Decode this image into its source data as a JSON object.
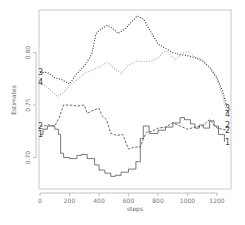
{
  "chart_data": {
    "type": "line",
    "title": "",
    "xlabel": "steps",
    "ylabel": "Estimates",
    "xlim": [
      0,
      1280
    ],
    "ylim": [
      0.68,
      0.84
    ],
    "xticks": [
      0,
      200,
      400,
      600,
      800,
      1000,
      1200
    ],
    "yticks": [
      0.7,
      0.75,
      0.8
    ],
    "ytick_labels": [
      "0.70",
      "0.75",
      "0.80"
    ],
    "grid": false,
    "legend": "line end labels (1-4) on left and right edges",
    "series": [
      {
        "name": "1",
        "style": "solid",
        "color": "#555555",
        "x": [
          0,
          20,
          50,
          100,
          125,
          140,
          160,
          200,
          250,
          280,
          320,
          370,
          400,
          440,
          480,
          510,
          550,
          600,
          640,
          650,
          680,
          700,
          740,
          800,
          850,
          900,
          950,
          980,
          1020,
          1050,
          1080,
          1110,
          1150,
          1180,
          1210,
          1250
        ],
        "values": [
          0.722,
          0.727,
          0.73,
          0.727,
          0.722,
          0.704,
          0.7,
          0.699,
          0.702,
          0.703,
          0.699,
          0.693,
          0.688,
          0.685,
          0.682,
          0.683,
          0.686,
          0.689,
          0.689,
          0.696,
          0.718,
          0.73,
          0.723,
          0.726,
          0.729,
          0.733,
          0.738,
          0.736,
          0.732,
          0.728,
          0.731,
          0.728,
          0.735,
          0.73,
          0.722,
          0.715
        ]
      },
      {
        "name": "2",
        "style": "dashed",
        "color": "#444444",
        "x": [
          0,
          30,
          60,
          100,
          130,
          160,
          200,
          250,
          300,
          320,
          360,
          400,
          420,
          450,
          480,
          520,
          560,
          600,
          640,
          680,
          720,
          760,
          800,
          850,
          900,
          950,
          1000,
          1050,
          1100,
          1150,
          1200,
          1270
        ],
        "values": [
          0.73,
          0.73,
          0.731,
          0.73,
          0.738,
          0.75,
          0.75,
          0.749,
          0.75,
          0.742,
          0.745,
          0.747,
          0.74,
          0.736,
          0.723,
          0.721,
          0.722,
          0.708,
          0.71,
          0.71,
          0.724,
          0.725,
          0.728,
          0.729,
          0.733,
          0.73,
          0.727,
          0.729,
          0.73,
          0.736,
          0.728,
          0.726
        ]
      },
      {
        "name": "3",
        "style": "dotted",
        "color": "#333333",
        "x": [
          0,
          50,
          100,
          150,
          200,
          250,
          300,
          350,
          380,
          420,
          460,
          500,
          530,
          580,
          620,
          660,
          700,
          750,
          800,
          850,
          900,
          950,
          1000,
          1050,
          1100,
          1150,
          1200,
          1240,
          1270
        ],
        "values": [
          0.781,
          0.781,
          0.776,
          0.774,
          0.77,
          0.78,
          0.787,
          0.798,
          0.818,
          0.823,
          0.826,
          0.822,
          0.818,
          0.823,
          0.829,
          0.835,
          0.832,
          0.82,
          0.808,
          0.804,
          0.8,
          0.798,
          0.797,
          0.795,
          0.792,
          0.786,
          0.776,
          0.762,
          0.747
        ]
      },
      {
        "name": "4",
        "style": "dotted",
        "color": "#aaaaaa",
        "x": [
          0,
          40,
          80,
          120,
          160,
          200,
          250,
          300,
          350,
          400,
          460,
          500,
          550,
          600,
          650,
          700,
          760,
          800,
          850,
          880,
          920,
          960,
          1000,
          1050,
          1100,
          1150,
          1200,
          1240,
          1270
        ],
        "values": [
          0.772,
          0.768,
          0.763,
          0.758,
          0.762,
          0.768,
          0.774,
          0.78,
          0.783,
          0.786,
          0.791,
          0.785,
          0.78,
          0.788,
          0.792,
          0.791,
          0.792,
          0.795,
          0.802,
          0.798,
          0.793,
          0.799,
          0.801,
          0.796,
          0.793,
          0.785,
          0.775,
          0.757,
          0.741
        ]
      }
    ],
    "left_labels": [
      {
        "text": "3",
        "y": 0.781
      },
      {
        "text": "4",
        "y": 0.772
      },
      {
        "text": "2",
        "y": 0.73
      },
      {
        "text": "1",
        "y": 0.722
      }
    ],
    "right_labels": [
      {
        "text": "3",
        "y": 0.747
      },
      {
        "text": "4",
        "y": 0.741
      },
      {
        "text": "2",
        "y": 0.731
      },
      {
        "text": "2",
        "y": 0.726
      },
      {
        "text": "1",
        "y": 0.715
      }
    ]
  }
}
